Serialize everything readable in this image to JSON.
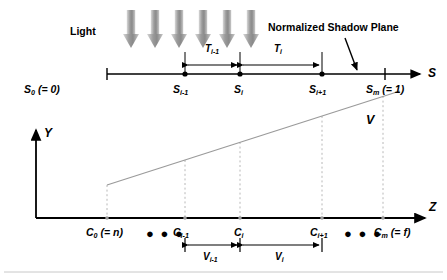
{
  "figure": {
    "title_text": "",
    "labels": {
      "light": "Light",
      "shadow_plane": "Normalized Shadow Plane",
      "axis_s": "S",
      "axis_y": "Y",
      "axis_z": "Z",
      "v_curve": "V"
    },
    "colors": {
      "ink": "#000000",
      "arrow_gray_dark": "#8c8c8c",
      "arrow_gray_light": "#d9d9d9",
      "dashed_gray": "#b3b3b3",
      "curve_gray": "#9a9a9a",
      "rule_gray": "#c8c8c8",
      "background": "#ffffff"
    },
    "light_arrows": {
      "count": 6,
      "x_positions": [
        131,
        155,
        179,
        203,
        227,
        251
      ],
      "top": 10,
      "bottom": 48
    },
    "s_axis": {
      "y": 74,
      "x_start": 107,
      "x_end": 420,
      "ticks": [
        {
          "name": "s0",
          "x": 107,
          "label_main": "S",
          "label_sub": "0",
          "label_eq": "(= 0)",
          "dot": false
        },
        {
          "name": "si-1",
          "x": 185,
          "label_main": "S",
          "label_sub": "i-1",
          "label_eq": "",
          "dot": true
        },
        {
          "name": "si",
          "x": 240,
          "label_main": "S",
          "label_sub": "i",
          "label_eq": "",
          "dot": true
        },
        {
          "name": "si+1",
          "x": 322,
          "label_main": "S",
          "label_sub": "i+1",
          "label_eq": "",
          "dot": true
        },
        {
          "name": "sm",
          "x": 385,
          "label_main": "S",
          "label_sub": "m",
          "label_eq": "(= 1)",
          "dot": false
        }
      ],
      "spans": [
        {
          "name": "T_i-1",
          "label_main": "T",
          "label_sub": "i-1",
          "x_from": 185,
          "x_to": 240,
          "y": 58
        },
        {
          "name": "T_i",
          "label_main": "T",
          "label_sub": "i",
          "x_from": 240,
          "x_to": 322,
          "y": 58
        }
      ]
    },
    "z_axis": {
      "y": 218,
      "x_start": 36,
      "x_end": 425,
      "ticks": [
        {
          "name": "c0",
          "x": 107,
          "label_main": "C",
          "label_sub": "0",
          "label_eq": "(= n)"
        },
        {
          "name": "ci-1",
          "x": 185,
          "label_main": "C",
          "label_sub": "i-1",
          "label_eq": ""
        },
        {
          "name": "ci",
          "x": 240,
          "label_main": "C",
          "label_sub": "i",
          "label_eq": ""
        },
        {
          "name": "ci+1",
          "x": 322,
          "label_main": "C",
          "label_sub": "i+1",
          "label_eq": ""
        },
        {
          "name": "cm",
          "x": 383,
          "label_main": "C",
          "label_sub": "m",
          "label_eq": "(= f)"
        }
      ],
      "ellipses": [
        {
          "name": "ellipsis-left",
          "x": 150,
          "text": "● ● ●"
        },
        {
          "name": "ellipsis-right",
          "x": 345,
          "text": "● ● ●"
        }
      ],
      "spans": [
        {
          "name": "V_i-1",
          "label_main": "V",
          "label_sub": "i-1",
          "x_from": 185,
          "x_to": 240,
          "y": 247
        },
        {
          "name": "V_i",
          "label_main": "V",
          "label_sub": "i",
          "x_from": 240,
          "x_to": 322,
          "y": 247
        }
      ]
    },
    "y_axis": {
      "x": 36,
      "y_top": 130,
      "y_bottom": 218
    },
    "v_curve": {
      "x_from": 107,
      "y_from": 185,
      "x_to": 400,
      "y_to": 91,
      "label_x": 368,
      "label_y": 115
    },
    "drop_lines": [
      {
        "name": "drop-c0",
        "x": 107,
        "y_top": 185,
        "y_bottom": 218
      },
      {
        "name": "drop-ci-1",
        "x": 185,
        "y_top": 160,
        "y_bottom": 218
      },
      {
        "name": "drop-ci",
        "x": 240,
        "y_top": 142,
        "y_bottom": 218
      },
      {
        "name": "drop-ci+1",
        "x": 322,
        "y_top": 116,
        "y_bottom": 218
      },
      {
        "name": "drop-cm",
        "x": 383,
        "y_top": 96,
        "y_bottom": 218
      }
    ],
    "pointer": {
      "name": "shadow-plane-pointer",
      "x_from": 345,
      "y_from": 38,
      "x_to": 357,
      "y_to": 70
    },
    "bottom_rule": {
      "y": 272,
      "x_from": 4,
      "x_to": 443
    }
  }
}
